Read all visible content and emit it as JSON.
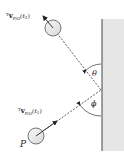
{
  "diagram": {
    "type": "physics-collision",
    "labels": {
      "v_t2_prefix": "T",
      "v_t2_main": "v",
      "v_t2_sub": "P/O",
      "v_t2_arg": "(t",
      "v_t2_argsub": "2",
      "v_t2_close": ")",
      "v_t1_prefix": "T",
      "v_t1_main": "v",
      "v_t1_sub": "P/O",
      "v_t1_arg": "(t",
      "v_t1_argsub": "1",
      "v_t1_close": ")",
      "angle_theta": "θ",
      "angle_phi": "ϕ",
      "particle": "P"
    },
    "colors": {
      "wall_fill": "#e6e6e6",
      "wall_edge": "#444444",
      "ball_fill": "#ececec",
      "ball_edge": "#555555",
      "line": "#333333"
    }
  }
}
